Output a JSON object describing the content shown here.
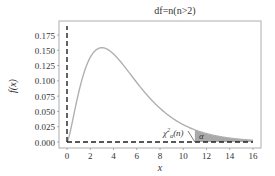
{
  "chart_data": {
    "type": "line",
    "title": "df=n(n>2)",
    "xlabel": "x",
    "ylabel": "f(x)",
    "xlim": [
      -0.8,
      17.2
    ],
    "ylim": [
      -0.006,
      0.19
    ],
    "x_ticks": [
      0,
      2,
      4,
      6,
      8,
      10,
      12,
      14,
      16
    ],
    "y_ticks": [
      0.0,
      0.025,
      0.05,
      0.075,
      0.1,
      0.125,
      0.15,
      0.175
    ],
    "y_tick_labels": [
      "0.000",
      "0.025",
      "0.050",
      "0.075",
      "0.100",
      "0.125",
      "0.150",
      "0.175"
    ],
    "grid": false,
    "series": [
      {
        "name": "chi-square pdf",
        "df": 5,
        "x": [
          0,
          0.5,
          1,
          1.5,
          2,
          2.5,
          3,
          3.5,
          4,
          5,
          6,
          7,
          8,
          9,
          10,
          11,
          12,
          13,
          14,
          15,
          16
        ],
        "values": [
          0,
          0.0366,
          0.0807,
          0.1153,
          0.1383,
          0.1505,
          0.1542,
          0.1515,
          0.1442,
          0.122,
          0.0973,
          0.0744,
          0.0551,
          0.0398,
          0.0283,
          0.0198,
          0.0137,
          0.0094,
          0.0064,
          0.0043,
          0.0029
        ],
        "color": "#b0b0b0"
      }
    ],
    "shaded_region": {
      "from": 11,
      "to": 16,
      "color": "#a9a9a9",
      "label": "α"
    },
    "annotations": [
      {
        "text": "χ²α(n)",
        "x": 8.2,
        "y": 0.012
      },
      {
        "text": "α",
        "x": 11.8,
        "y": 0.006
      }
    ],
    "reference_lines": [
      {
        "type": "vertical",
        "x": 0,
        "style": "dashed",
        "color": "#222"
      },
      {
        "type": "horizontal",
        "y": 0,
        "style": "dashed",
        "color": "#222"
      }
    ]
  }
}
